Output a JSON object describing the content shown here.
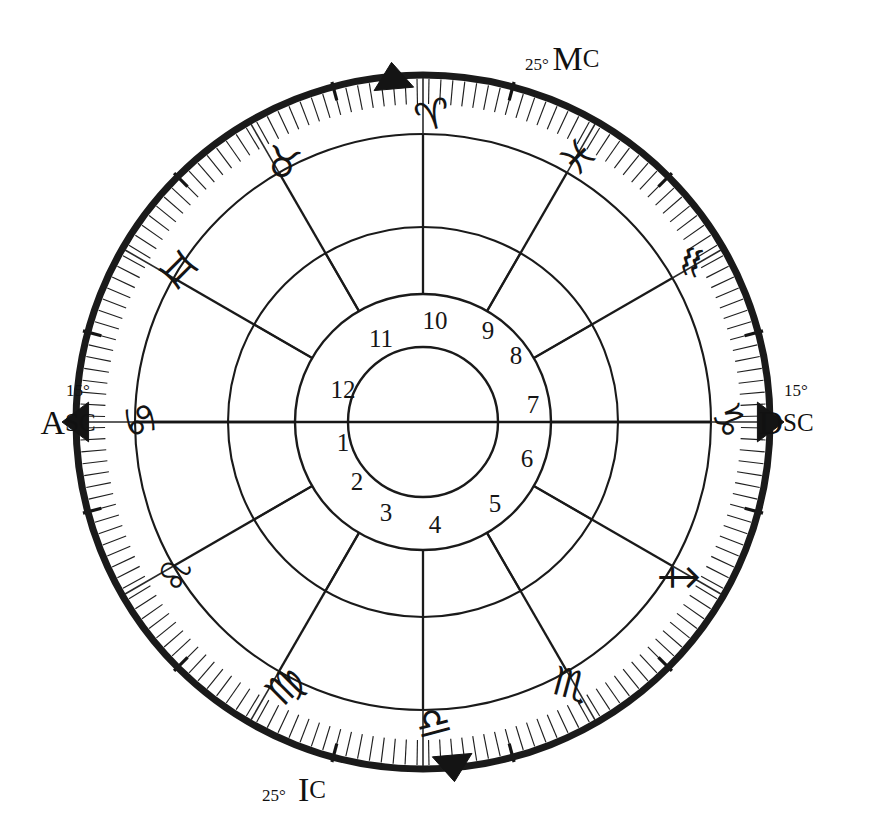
{
  "chart": {
    "type": "natal-house-wheel",
    "center": {
      "x": 423,
      "y": 422
    },
    "radii": {
      "outer_heavy_ring": 347,
      "tick_band_inner": 318,
      "zodiac_band_inner": 288,
      "house_cusp_outer": 195,
      "house_number_ring_inner": 128,
      "inner_blank_circle": 75
    },
    "tick_marks": {
      "minor_step_degrees": 2,
      "major_step_degrees": 30
    },
    "house_system_note": "equal-house, 12 sectors of 30 degrees",
    "direction": "counterclockwise"
  },
  "angles": [
    {
      "name": "Ascendant",
      "abbrev_head": "A",
      "abbrev_tail": "SC",
      "degree_label": "15°",
      "sign": "Cancer",
      "position_degrees": 180,
      "label_x": 68,
      "label_y": 422,
      "degree_x": 78,
      "degree_y": 390,
      "anchor": "middle",
      "marker_angle": 180
    },
    {
      "name": "Descendant",
      "abbrev_head": "D",
      "abbrev_tail": "SC",
      "degree_label": "15°",
      "sign": "Capricorn",
      "position_degrees": 0,
      "label_x": 786,
      "label_y": 422,
      "degree_x": 796,
      "degree_y": 390,
      "anchor": "middle",
      "marker_angle": 0
    },
    {
      "name": "Medium Coeli",
      "abbrev_head": "M",
      "abbrev_tail": "C",
      "degree_label": "25°",
      "sign": "Aries",
      "position_degrees": 95,
      "label_x": 576,
      "label_y": 58,
      "degree_x": 537,
      "degree_y": 64,
      "anchor": "middle",
      "marker_angle": 95
    },
    {
      "name": "Imum Coeli",
      "abbrev_head": "I",
      "abbrev_tail": "C",
      "degree_label": "25°",
      "sign": "Libra",
      "position_degrees": 275,
      "label_x": 312,
      "label_y": 789,
      "degree_x": 274,
      "degree_y": 795,
      "anchor": "middle",
      "marker_angle": 275
    }
  ],
  "zodiac_signs": [
    {
      "name": "Cancer",
      "glyph": "♋",
      "order": 4,
      "center_angle": 165,
      "glyph_rotation": 75,
      "glyph_x": 140,
      "glyph_y": 420
    },
    {
      "name": "Gemini",
      "glyph": "♊",
      "order": 3,
      "center_angle": 135,
      "glyph_rotation": 45,
      "glyph_x": 178,
      "glyph_y": 270
    },
    {
      "name": "Taurus",
      "glyph": "♉",
      "order": 2,
      "center_angle": 105,
      "glyph_rotation": 15,
      "glyph_x": 283,
      "glyph_y": 163
    },
    {
      "name": "Aries",
      "glyph": "♈",
      "order": 1,
      "center_angle": 75,
      "glyph_rotation": -15,
      "glyph_x": 433,
      "glyph_y": 115
    },
    {
      "name": "Pisces",
      "glyph": "♓",
      "order": 12,
      "center_angle": 45,
      "glyph_rotation": -45,
      "glyph_x": 578,
      "glyph_y": 157
    },
    {
      "name": "Aquarius",
      "glyph": "♒",
      "order": 11,
      "center_angle": 15,
      "glyph_rotation": -75,
      "glyph_x": 692,
      "glyph_y": 262
    },
    {
      "name": "Capricorn",
      "glyph": "♑",
      "order": 10,
      "center_angle": 345,
      "glyph_rotation": 75,
      "glyph_x": 729,
      "glyph_y": 420
    },
    {
      "name": "Sagittarius",
      "glyph": "♐",
      "order": 9,
      "center_angle": 315,
      "glyph_rotation": 45,
      "glyph_x": 678,
      "glyph_y": 578
    },
    {
      "name": "Scorpio",
      "glyph": "♏",
      "order": 8,
      "center_angle": 285,
      "glyph_rotation": 15,
      "glyph_x": 571,
      "glyph_y": 684
    },
    {
      "name": "Libra",
      "glyph": "♎",
      "order": 7,
      "center_angle": 255,
      "glyph_rotation": -15,
      "glyph_x": 433,
      "glyph_y": 722
    },
    {
      "name": "Virgo",
      "glyph": "♍",
      "order": 6,
      "center_angle": 225,
      "glyph_rotation": -45,
      "glyph_x": 285,
      "glyph_y": 686
    },
    {
      "name": "Leo",
      "glyph": "♌",
      "order": 5,
      "center_angle": 195,
      "glyph_rotation": -75,
      "glyph_x": 175,
      "glyph_y": 575
    }
  ],
  "houses": [
    {
      "number": "1",
      "center_angle": 195,
      "x": 343,
      "y": 442
    },
    {
      "number": "2",
      "center_angle": 225,
      "x": 357,
      "y": 481
    },
    {
      "number": "3",
      "center_angle": 255,
      "x": 386,
      "y": 512
    },
    {
      "number": "4",
      "center_angle": 285,
      "x": 435,
      "y": 524
    },
    {
      "number": "5",
      "center_angle": 315,
      "x": 495,
      "y": 503
    },
    {
      "number": "6",
      "center_angle": 345,
      "x": 527,
      "y": 458
    },
    {
      "number": "7",
      "center_angle": 15,
      "x": 533,
      "y": 404
    },
    {
      "number": "8",
      "center_angle": 45,
      "x": 516,
      "y": 355
    },
    {
      "number": "9",
      "center_angle": 75,
      "x": 488,
      "y": 330
    },
    {
      "number": "10",
      "center_angle": 105,
      "x": 435,
      "y": 320
    },
    {
      "number": "11",
      "center_angle": 135,
      "x": 381,
      "y": 338
    },
    {
      "number": "12",
      "center_angle": 165,
      "x": 343,
      "y": 389
    }
  ],
  "colors": {
    "ink": "#141414",
    "line": "#1a1a1a",
    "background": "#ffffff"
  }
}
